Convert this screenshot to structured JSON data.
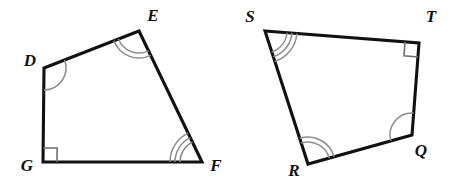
{
  "figure": {
    "background_color": "#ffffff",
    "edge_color": "#111111",
    "arc_color": "#8d8d8d",
    "right_angle_color": "#6f6f6f",
    "label_color": "#111111"
  },
  "shapes": [
    {
      "name": "quadrilateral-defg",
      "vertex_order": "D-E-F-G",
      "vertices": [
        {
          "label": "D",
          "x": 44,
          "y": 68,
          "label_x": 30,
          "label_y": 62,
          "angle_mark": "arcs",
          "arc_count": 1
        },
        {
          "label": "E",
          "x": 139,
          "y": 31,
          "label_x": 153,
          "label_y": 17,
          "angle_mark": "arcs",
          "arc_count": 2
        },
        {
          "label": "F",
          "x": 202,
          "y": 162,
          "label_x": 216,
          "label_y": 167,
          "angle_mark": "arcs",
          "arc_count": 3
        },
        {
          "label": "G",
          "x": 43,
          "y": 162,
          "label_x": 27,
          "label_y": 167,
          "angle_mark": "right-angle",
          "arc_count": 0
        }
      ]
    },
    {
      "name": "quadrilateral-stqr",
      "vertex_order": "S-T-Q-R",
      "vertices": [
        {
          "label": "S",
          "x": 265,
          "y": 31,
          "label_x": 250,
          "label_y": 18,
          "angle_mark": "arcs",
          "arc_count": 3
        },
        {
          "label": "T",
          "x": 419,
          "y": 43,
          "label_x": 431,
          "label_y": 18,
          "angle_mark": "right-angle",
          "arc_count": 0
        },
        {
          "label": "Q",
          "x": 412,
          "y": 135,
          "label_x": 421,
          "label_y": 152,
          "angle_mark": "arcs",
          "arc_count": 1
        },
        {
          "label": "R",
          "x": 308,
          "y": 164,
          "label_x": 294,
          "label_y": 172,
          "angle_mark": "arcs",
          "arc_count": 2
        }
      ]
    }
  ],
  "angle_marks": {
    "arc_base_radius": 22,
    "arc_spacing": 5,
    "right_angle_size": 14,
    "legend": {
      "one_arc": "D and Q",
      "two_arcs": "E and R",
      "three_arcs": "F and S",
      "right_angle": "G and T"
    }
  }
}
